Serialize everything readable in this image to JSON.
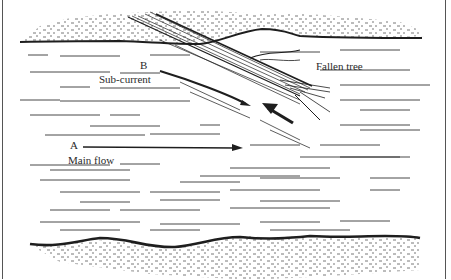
{
  "figure": {
    "labels": {
      "point_a": "A",
      "point_b": "B",
      "main_flow": "Main flow",
      "sub_current": "Sub-current",
      "fallen_tree": "Fallen tree"
    },
    "colors": {
      "ink": "#1e1e1e",
      "background": "#ffffff",
      "stipple": "#3a3a3a"
    }
  }
}
